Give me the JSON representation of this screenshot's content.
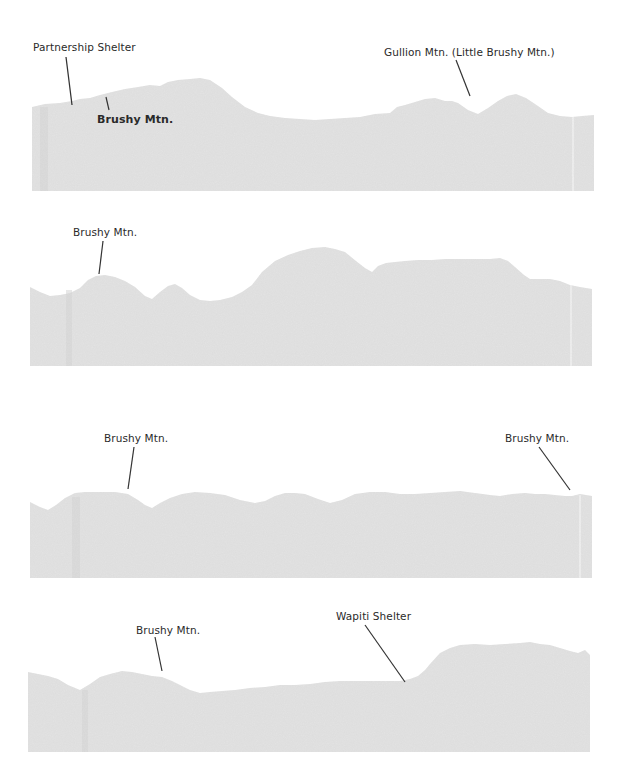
{
  "diagram": {
    "type": "elevation-profile",
    "fill_color": "#e2e2e2",
    "line_color": "#333333",
    "panels": [
      {
        "id": 1,
        "labels": [
          {
            "text": "Partnership Shelter",
            "x": 33,
            "y": 40
          },
          {
            "text": "Brushy Mtn.",
            "x": 97,
            "y": 113
          },
          {
            "text": "Gullion Mtn. (Little Brushy Mtn.)",
            "x": 384,
            "y": 45
          }
        ]
      },
      {
        "id": 2,
        "labels": [
          {
            "text": "Brushy Mtn.",
            "x": 73,
            "y": 225
          }
        ]
      },
      {
        "id": 3,
        "labels": [
          {
            "text": "Brushy Mtn.",
            "x": 104,
            "y": 432
          }
        ],
        "right_labels": []
      },
      {
        "id": 3,
        "labels": [
          {
            "text": "Brushy Mtn.",
            "x": 505,
            "y": 432
          }
        ]
      },
      {
        "id": 4,
        "labels": [
          {
            "text": "Brushy Mtn.",
            "x": 136,
            "y": 624
          },
          {
            "text": "Wapiti Shelter",
            "x": 336,
            "y": 610
          }
        ]
      }
    ]
  },
  "labels": {
    "p1_partnership": "Partnership Shelter",
    "p1_brushy": "Brushy Mtn.",
    "p1_gullion": "Gullion Mtn. (Little Brushy Mtn.)",
    "p2_brushy": "Brushy Mtn.",
    "p3_brushy_left": "Brushy Mtn.",
    "p3_brushy_right": "Brushy Mtn.",
    "p4_brushy": "Brushy Mtn.",
    "p4_wapiti": "Wapiti Shelter"
  }
}
